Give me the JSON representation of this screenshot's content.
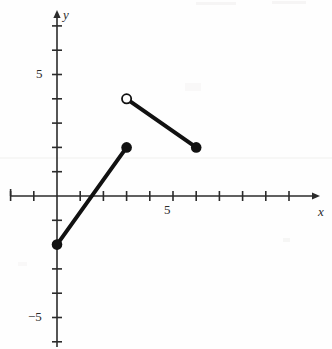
{
  "figure": {
    "width": 332,
    "height": 349,
    "background_color": "#fefefe",
    "ink_color": "#1a1a1a"
  },
  "axes": {
    "x_label": "x",
    "y_label": "y",
    "origin_px": {
      "x": 57,
      "y": 196
    },
    "unit_px": {
      "x": 23.2,
      "y": 24.3
    },
    "x_axis_pixel_span": {
      "start": 10,
      "end": 318
    },
    "y_axis_pixel_span": {
      "start": 12,
      "end": 349
    },
    "x_arrow": "right",
    "y_arrow": "up",
    "tick_length_px": 5,
    "x_tick_labels": [
      {
        "value": 5,
        "text": "5"
      }
    ],
    "y_tick_labels": [
      {
        "value": 5,
        "text": "5"
      },
      {
        "value": -5,
        "text": "−5"
      }
    ]
  },
  "chart_data": {
    "type": "line",
    "title": "",
    "xlabel": "x",
    "ylabel": "y",
    "xlim": [
      -2,
      11.3
    ],
    "ylim": [
      -6.3,
      7.6
    ],
    "xticks": [
      -2,
      -1,
      0,
      1,
      2,
      3,
      4,
      5,
      6,
      7,
      8,
      9,
      10,
      11
    ],
    "yticks": [
      -6,
      -5,
      -4,
      -3,
      -2,
      -1,
      0,
      1,
      2,
      3,
      4,
      5,
      6,
      7
    ],
    "xtick_labels": {
      "5": "5"
    },
    "ytick_labels": {
      "5": "5",
      "-5": "−5"
    },
    "grid": false,
    "legend": null,
    "series": [
      {
        "name": "segment-1",
        "points": [
          {
            "x": 0,
            "y": -2
          },
          {
            "x": 3,
            "y": 2
          }
        ],
        "endpoints": [
          {
            "x": 0,
            "y": -2,
            "marker": "closed"
          },
          {
            "x": 3,
            "y": 2,
            "marker": "closed"
          }
        ],
        "color": "#111111",
        "line_width_px": 4
      },
      {
        "name": "segment-2",
        "points": [
          {
            "x": 3,
            "y": 4
          },
          {
            "x": 6,
            "y": 2
          }
        ],
        "endpoints": [
          {
            "x": 3,
            "y": 4,
            "marker": "open"
          },
          {
            "x": 6,
            "y": 2,
            "marker": "closed"
          }
        ],
        "color": "#111111",
        "line_width_px": 4
      }
    ]
  }
}
